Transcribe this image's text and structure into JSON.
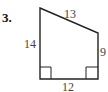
{
  "problem": {
    "number": "3."
  },
  "figure": {
    "shape": "right trapezoid",
    "stroke_color": "#222222",
    "vertices": {
      "top_left": [
        40,
        8
      ],
      "top_right": [
        98,
        33
      ],
      "bottom_right": [
        98,
        79
      ],
      "bottom_left": [
        40,
        79
      ]
    },
    "sides": {
      "left": "14",
      "top": "13",
      "right": "9",
      "bottom": "12"
    },
    "right_angles": [
      "bottom-left",
      "bottom-right"
    ]
  }
}
